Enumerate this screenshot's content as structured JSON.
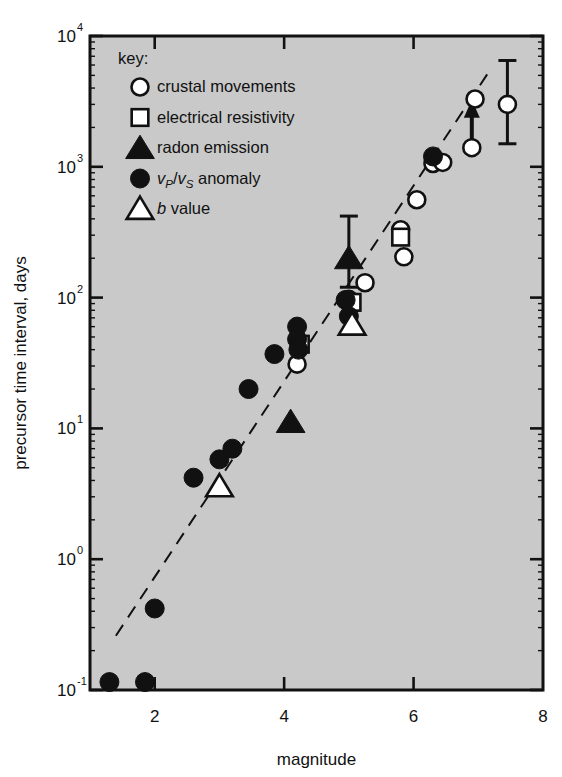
{
  "chart_data": {
    "type": "scatter",
    "title": "",
    "xlabel": "magnitude",
    "ylabel": "precursor time interval, days",
    "xlim": [
      1.0,
      8.0
    ],
    "ylim": [
      0.1,
      10000
    ],
    "yscale": "log",
    "xscale": "linear",
    "grid": false,
    "legend_position": "top-left",
    "legend_title": "key:",
    "xticks": [
      "2",
      "4",
      "6",
      "8"
    ],
    "xtick_values": [
      2,
      4,
      6,
      8
    ],
    "ytick_labels": [
      "10",
      "10",
      "10",
      "10",
      "10",
      "10"
    ],
    "ytick_exponents": [
      "-1",
      "0",
      "1",
      "2",
      "3",
      "4"
    ],
    "ytick_values": [
      0.1,
      1,
      10,
      100,
      1000,
      10000
    ],
    "series": [
      {
        "name": "crustal movements",
        "marker": "open-circle",
        "points": [
          {
            "x": 4.2,
            "y": 31
          },
          {
            "x": 5.0,
            "y": 97
          },
          {
            "x": 5.25,
            "y": 130
          },
          {
            "x": 5.85,
            "y": 205
          },
          {
            "x": 5.8,
            "y": 330
          },
          {
            "x": 6.05,
            "y": 560
          },
          {
            "x": 6.3,
            "y": 1060
          },
          {
            "x": 6.45,
            "y": 1080
          },
          {
            "x": 6.9,
            "y": 1400,
            "arrow": "up"
          },
          {
            "x": 6.95,
            "y": 3300
          },
          {
            "x": 7.45,
            "y": 3000,
            "err_lo": 1500,
            "err_hi": 6500
          }
        ]
      },
      {
        "name": "electrical resistivity",
        "marker": "open-square",
        "points": [
          {
            "x": 4.25,
            "y": 44
          },
          {
            "x": 5.05,
            "y": 92
          },
          {
            "x": 5.8,
            "y": 290
          }
        ]
      },
      {
        "name": "radon emission",
        "marker": "filled-triangle",
        "points": [
          {
            "x": 4.1,
            "y": 11.2
          },
          {
            "x": 5.0,
            "y": 200,
            "err_lo": 120,
            "err_hi": 420
          }
        ]
      },
      {
        "name": "vP/vS anomaly",
        "marker": "filled-circle",
        "points": [
          {
            "x": 1.3,
            "y": 0.115
          },
          {
            "x": 1.85,
            "y": 0.115
          },
          {
            "x": 2.0,
            "y": 0.42
          },
          {
            "x": 2.6,
            "y": 4.2
          },
          {
            "x": 3.0,
            "y": 5.8
          },
          {
            "x": 3.2,
            "y": 7.0
          },
          {
            "x": 3.45,
            "y": 20
          },
          {
            "x": 3.85,
            "y": 37
          },
          {
            "x": 4.2,
            "y": 60
          },
          {
            "x": 4.2,
            "y": 48
          },
          {
            "x": 4.22,
            "y": 40
          },
          {
            "x": 4.95,
            "y": 96
          },
          {
            "x": 5.0,
            "y": 72
          },
          {
            "x": 6.3,
            "y": 1200
          }
        ]
      },
      {
        "name": "b value",
        "marker": "open-triangle",
        "points": [
          {
            "x": 3.0,
            "y": 3.6
          },
          {
            "x": 5.05,
            "y": 62
          }
        ]
      }
    ],
    "trendline": {
      "style": "dashed",
      "x_start": 1.4,
      "y_start": 0.26,
      "x_end": 7.15,
      "y_end": 5200
    }
  },
  "legend": {
    "title": "key:",
    "entries": [
      {
        "label": "crustal movements",
        "marker": "open-circle"
      },
      {
        "label": "electrical resistivity",
        "marker": "open-square"
      },
      {
        "label": "radon emission",
        "marker": "filled-triangle"
      },
      {
        "label": "anomaly",
        "marker": "filled-circle",
        "prefix_v1": "v",
        "sub1": "P",
        "slash": "/",
        "prefix_v2": "v",
        "sub2": "S"
      },
      {
        "label": "value",
        "marker": "open-triangle",
        "italic_prefix": "b"
      }
    ]
  },
  "axes": {
    "x_title": "magnitude",
    "y_title": "precursor time interval, days"
  },
  "colors": {
    "plot_background": "#c9c9c9",
    "ink": "#111111",
    "marker_fill_open": "#ffffff",
    "marker_fill_closed": "#111111",
    "page_background": "#ffffff"
  }
}
